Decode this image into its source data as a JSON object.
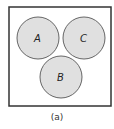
{
  "diagram": {
    "type": "venn",
    "caption": "(a)",
    "universe": {
      "x": 9,
      "y": 7,
      "width": 102,
      "height": 99,
      "stroke": "#333333"
    },
    "circles": [
      {
        "label": "A",
        "cx": 38,
        "cy": 38,
        "r": 21,
        "fill": "#e0e0e0"
      },
      {
        "label": "C",
        "cx": 84,
        "cy": 38,
        "r": 21,
        "fill": "#e0e0e0"
      },
      {
        "label": "B",
        "cx": 61,
        "cy": 77,
        "r": 21,
        "fill": "#e0e0e0"
      }
    ]
  }
}
